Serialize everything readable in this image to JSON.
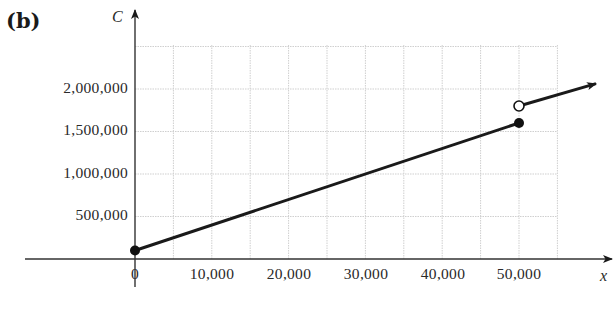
{
  "panel_label": "(b)",
  "chart_data": {
    "type": "line",
    "title": "",
    "xlabel": "x",
    "ylabel": "C",
    "xlim": [
      0,
      57500
    ],
    "ylim": [
      0,
      2500000
    ],
    "grid": true,
    "x_ticks": [
      "0",
      "10,000",
      "20,000",
      "30,000",
      "40,000",
      "50,000"
    ],
    "y_ticks": [
      "500,000",
      "1,000,000",
      "1,500,000",
      "2,000,000"
    ],
    "series": [
      {
        "name": "segment 1 (0 ≤ x ≤ 50,000)",
        "x": [
          0,
          50000
        ],
        "y": [
          100000,
          1600000
        ],
        "start_marker": "filled",
        "end_marker": "filled"
      },
      {
        "name": "segment 2 (x > 50,000)",
        "x": [
          50000,
          60000
        ],
        "y": [
          1800000,
          2060000
        ],
        "start_marker": "open",
        "end_marker": "arrow"
      }
    ]
  }
}
